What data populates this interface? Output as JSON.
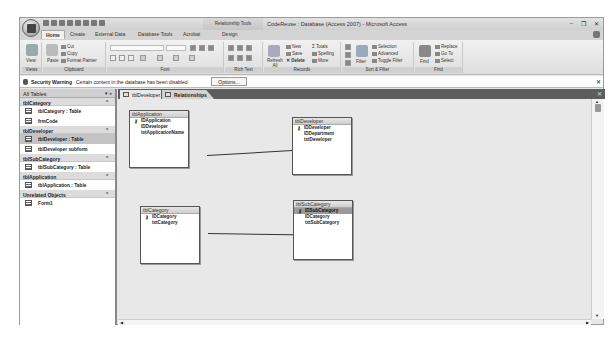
{
  "window": {
    "title": "CodeReuse : Database (Access 2007) - Microsoft Access",
    "context_tab": "Relationship Tools",
    "controls": {
      "minimize": "–",
      "restore": "❐",
      "close": "✕"
    }
  },
  "ribbon_tabs": [
    "Home",
    "Create",
    "External Data",
    "Database Tools",
    "Acrobat",
    "Design"
  ],
  "ribbon": {
    "views": {
      "label": "Views",
      "view": "View"
    },
    "clipboard": {
      "label": "Clipboard",
      "paste": "Paste",
      "cut": "Cut",
      "copy": "Copy",
      "format_painter": "Format Painter"
    },
    "font": {
      "label": "Font"
    },
    "rich_text": {
      "label": "Rich Text"
    },
    "records": {
      "label": "Records",
      "refresh": "Refresh All",
      "new": "New",
      "save": "Save",
      "delete": "Delete",
      "totals": "Totals",
      "spelling": "Spelling",
      "more": "More"
    },
    "sort_filter": {
      "label": "Sort & Filter",
      "filter": "Filter",
      "selection": "Selection",
      "advanced": "Advanced",
      "toggle": "Toggle Filter"
    },
    "find": {
      "label": "Find",
      "find": "Find",
      "replace": "Replace",
      "goto": "Go To",
      "select": "Select"
    }
  },
  "security_bar": {
    "title": "Security Warning",
    "message": "Certain content in the database has been disabled",
    "options": "Options..."
  },
  "nav_pane": {
    "header": "All Tables",
    "groups": [
      {
        "name": "tblCategory",
        "items": [
          "tblCategory : Table",
          "frmCode"
        ]
      },
      {
        "name": "tblDeveloper",
        "items": [
          "tblDeveloper : Table",
          "tblDeveloper subform"
        ]
      },
      {
        "name": "tblSubCategory",
        "items": [
          "tblSubCategory : Table"
        ]
      },
      {
        "name": "tblApplication",
        "items": [
          "tblApplication : Table"
        ]
      },
      {
        "name": "Unrelated Objects",
        "items": [
          "Form1"
        ]
      }
    ]
  },
  "doc_tabs": [
    "tblDeveloper",
    "Relationships"
  ],
  "tables": {
    "tblApplication": {
      "title": "tblApplication",
      "fields": [
        "IDApplication",
        "IDDeveloper",
        "txtApplicationName"
      ]
    },
    "tblDeveloper": {
      "title": "tblDeveloper",
      "fields": [
        "IDDeveloper",
        "IDDepartment",
        "txtDeveloper"
      ]
    },
    "tblCategory": {
      "title": "tblCategory",
      "fields": [
        "IDCategory",
        "txtCategory"
      ]
    },
    "tblSubCategory": {
      "title": "tblSubCategory",
      "fields": [
        "IDSubCategory",
        "IDCategory",
        "txtSubCategory"
      ]
    }
  }
}
